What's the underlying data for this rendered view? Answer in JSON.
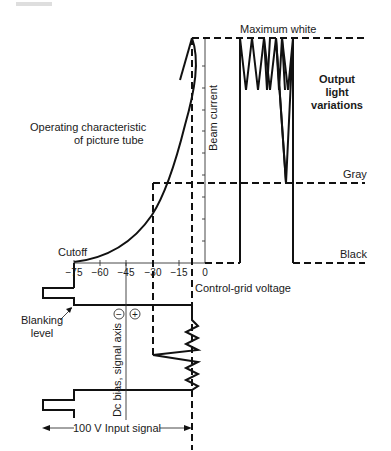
{
  "figure": {
    "top_fragment": "",
    "curve_label_line1": "Operating characteristic",
    "curve_label_line2": "of picture tube",
    "cutoff_label": "Cutoff",
    "beam_axis_label": "Beam current",
    "x_axis_label": "Control-grid voltage",
    "x_ticks": [
      "−75",
      "−60",
      "−45",
      "−30",
      "−15",
      "0"
    ],
    "levels": {
      "max_white": "Maximum white",
      "gray": "Gray",
      "black": "Black"
    },
    "output_label_line1": "Output",
    "output_label_line2": "light",
    "output_label_line3": "variations",
    "blanking_line1": "Blanking",
    "blanking_line2": "level",
    "signal_axis_label": "Dc bias, signal axis",
    "minus_sign": "−",
    "plus_sign": "+",
    "input_signal_label": "100 V Input signal"
  }
}
